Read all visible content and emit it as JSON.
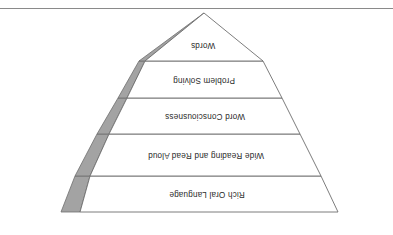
{
  "page": {
    "background_color": "#ffffff",
    "orientation_note": "figure rendered rotated 180 degrees (upside-down)",
    "top_rule_color": "#8a8a8a"
  },
  "diagram": {
    "name": "inverted-pyramid",
    "shape": "inverted triangle / funnel",
    "outline_color": "#6e6e6e",
    "fill_color": "#ffffff",
    "wedge_color": "#a3a3a3",
    "wedge_outline_color": "#6e6e6e",
    "apex_position": "bottom",
    "bands": [
      {
        "label": "Rich Oral Language"
      },
      {
        "label": "Wide Reading and Read Aloud"
      },
      {
        "label": "Word Consciousness"
      },
      {
        "label": "Problem Solving"
      },
      {
        "label": "Words"
      }
    ]
  }
}
